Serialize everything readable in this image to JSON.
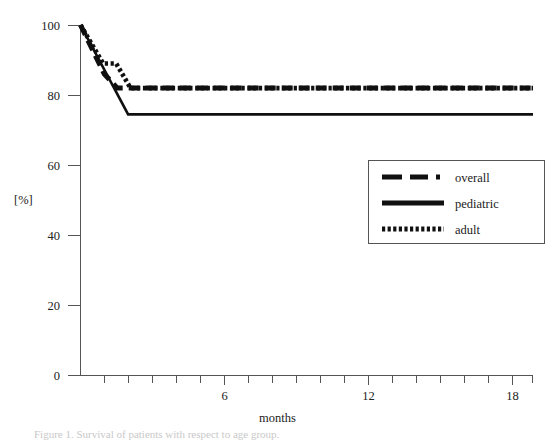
{
  "chart_data": {
    "type": "line",
    "title": "",
    "xlabel": "months",
    "ylabel": "[%]",
    "xlim": [
      0,
      19
    ],
    "ylim": [
      0,
      100
    ],
    "grid": false,
    "legend_position": "center-right",
    "x_ticks_major": [
      6,
      12,
      18
    ],
    "x_ticks_major_labels": [
      "6",
      "12",
      "18"
    ],
    "x_ticks_minor": [
      1,
      2,
      3,
      4,
      5,
      7,
      8,
      9,
      10,
      11,
      13,
      14,
      15,
      16,
      17,
      19
    ],
    "y_ticks": [
      0,
      20,
      40,
      60,
      80,
      100
    ],
    "y_tick_labels": [
      "0",
      "20",
      "40",
      "60",
      "80",
      "100"
    ],
    "series": [
      {
        "name": "overall",
        "style": "dashed",
        "points": [
          {
            "x": 0.0,
            "y": 100
          },
          {
            "x": 1.0,
            "y": 86
          },
          {
            "x": 1.55,
            "y": 82
          },
          {
            "x": 19.0,
            "y": 82
          }
        ]
      },
      {
        "name": "pediatric",
        "style": "solid",
        "points": [
          {
            "x": 0.0,
            "y": 100
          },
          {
            "x": 2.0,
            "y": 74.5
          },
          {
            "x": 19.0,
            "y": 74.5
          }
        ]
      },
      {
        "name": "adult",
        "style": "dotted",
        "points": [
          {
            "x": 0.0,
            "y": 100
          },
          {
            "x": 0.95,
            "y": 89
          },
          {
            "x": 1.5,
            "y": 89
          },
          {
            "x": 2.1,
            "y": 82
          },
          {
            "x": 19.0,
            "y": 82
          }
        ]
      }
    ]
  },
  "axes": {
    "y_label": "[%]",
    "x_label": "months",
    "y_tick_labels": [
      "100",
      "80",
      "60",
      "40",
      "20",
      "0"
    ],
    "x_tick_labels": [
      "6",
      "12",
      "18"
    ]
  },
  "legend": {
    "entries": [
      {
        "label": "overall",
        "style": "dashed"
      },
      {
        "label": "pediatric",
        "style": "solid"
      },
      {
        "label": "adult",
        "style": "dotted"
      }
    ]
  },
  "caption": {
    "text": "Figure 1. Survival of patients with respect to age group."
  }
}
